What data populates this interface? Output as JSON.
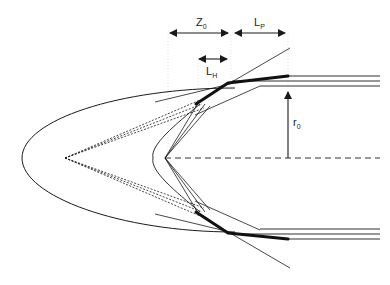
{
  "diagram": {
    "type": "geometric schematic",
    "labels": {
      "z0": {
        "main": "Z",
        "sub": "0"
      },
      "lp": {
        "main": "L",
        "sub": "P"
      },
      "lh": {
        "main": "L",
        "sub": "H"
      },
      "r0": {
        "main": "r",
        "sub": "0"
      }
    },
    "dimensions": [
      {
        "name": "Z0",
        "kind": "double-arrow horizontal"
      },
      {
        "name": "LP",
        "kind": "double-arrow horizontal"
      },
      {
        "name": "LH",
        "kind": "double-arrow horizontal"
      },
      {
        "name": "r0",
        "kind": "single-arrow vertical from axis"
      }
    ],
    "colors": {
      "stroke": "#1a1a1a",
      "guide": "#cccccc",
      "background": "#ffffff"
    }
  }
}
